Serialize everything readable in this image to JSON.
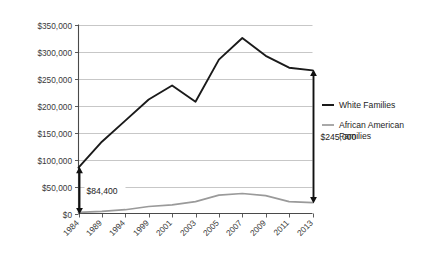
{
  "chart_data": {
    "type": "line",
    "title": "",
    "subtitle": "",
    "xlabel": "",
    "ylabel": "",
    "grid": "horizontal",
    "legend_position": "right",
    "categories": [
      "1984",
      "1989",
      "1994",
      "1999",
      "2001",
      "2003",
      "2005",
      "2007",
      "2009",
      "2011",
      "2013"
    ],
    "ylim": [
      0,
      350000
    ],
    "ytick_values": [
      0,
      50000,
      100000,
      150000,
      200000,
      250000,
      300000,
      350000
    ],
    "ytick_labels": [
      "$0",
      "$50,000",
      "$100,000",
      "$150,000",
      "$200,000",
      "$250,000",
      "$300,000",
      "$350,000"
    ],
    "series": [
      {
        "name": "White Families",
        "color": "#1a1a1a",
        "width": 1.9,
        "values": [
          85000,
          133000,
          172000,
          211000,
          237000,
          207000,
          285000,
          325000,
          292000,
          270000,
          265000
        ]
      },
      {
        "name": "African American Families",
        "color": "#9a9a9a",
        "width": 1.7,
        "values": [
          2000,
          4000,
          7000,
          13000,
          16000,
          22000,
          34000,
          37000,
          33000,
          22000,
          20000
        ]
      }
    ],
    "annotations": [
      {
        "name": "gap-1984",
        "label": "$84,400",
        "year": "1984",
        "from_value": 0,
        "to_value": 85000,
        "arrow": "double"
      },
      {
        "name": "gap-2013",
        "label": "$245,000",
        "year": "2013",
        "from_value": 20000,
        "to_value": 265000,
        "arrow": "double"
      }
    ]
  },
  "legend": {
    "items": [
      {
        "label": "White Families",
        "color": "#1a1a1a"
      },
      {
        "label": "African American",
        "label2": "Families",
        "color": "#9a9a9a"
      }
    ]
  }
}
